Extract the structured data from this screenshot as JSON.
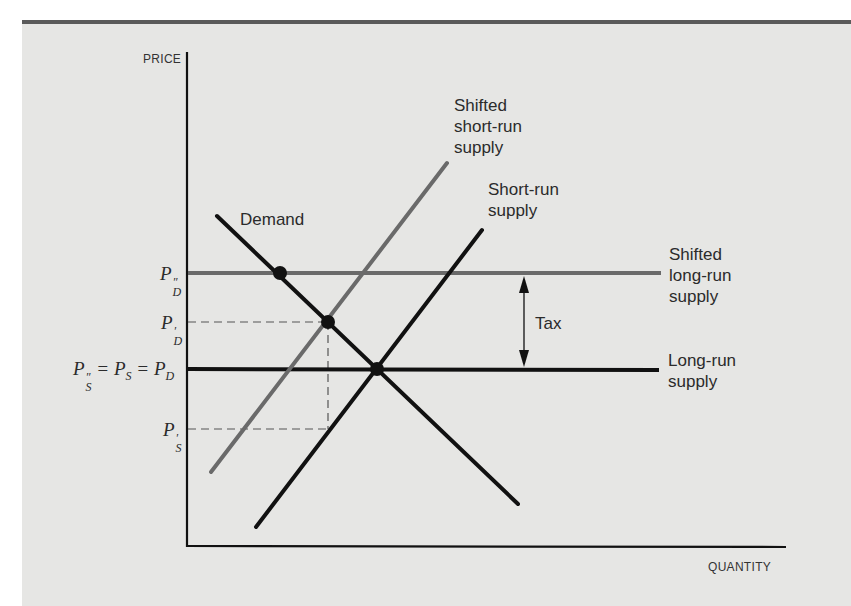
{
  "figure": {
    "axes": {
      "y_label": "PRICE",
      "x_label": "QUANTITY"
    },
    "curves": {
      "demand": {
        "label": "Demand",
        "color": "#111111"
      },
      "short_run_supply": {
        "label_line1": "Short-run",
        "label_line2": "supply",
        "color": "#111111"
      },
      "shifted_short_run_supply": {
        "label_line1": "Shifted",
        "label_line2": "short-run",
        "label_line3": "supply",
        "color": "#6a6a6a"
      },
      "long_run_supply": {
        "label_line1": "Long-run",
        "label_line2": "supply",
        "color": "#111111"
      },
      "shifted_long_run_supply": {
        "label_line1": "Shifted",
        "label_line2": "long-run",
        "label_line3": "supply",
        "color": "#6a6a6a"
      }
    },
    "annotations": {
      "tax_label": "Tax"
    },
    "price_levels": {
      "pd_double_prime": {
        "base": "P",
        "sub": "D",
        "mark": "″"
      },
      "pd_prime": {
        "base": "P",
        "sub": "D",
        "mark": "′"
      },
      "equilibrium": {
        "text": "P″S = PS = PD",
        "eq": "="
      },
      "ps_prime": {
        "base": "P",
        "sub": "S",
        "mark": "′"
      }
    }
  }
}
